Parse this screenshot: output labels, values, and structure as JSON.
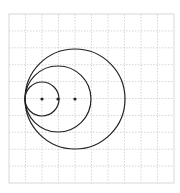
{
  "diagram": {
    "grid": {
      "x0": 9,
      "y0": 14,
      "cols": 10,
      "rows": 10,
      "cell_w": 16.5,
      "cell_h": 16.9,
      "line_color": "#cccccc",
      "border_color": "#d8d8d8"
    },
    "tangent_point": {
      "x": 25,
      "y": 99
    },
    "circles": [
      {
        "cx": 42,
        "cy": 99,
        "r": 17
      },
      {
        "cx": 58,
        "cy": 99,
        "r": 33
      },
      {
        "cx": 75,
        "cy": 99,
        "r": 50
      }
    ],
    "stroke_color": "#222222"
  }
}
